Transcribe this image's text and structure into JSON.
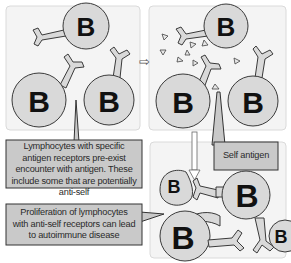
{
  "panels": {
    "top_left": {
      "cells": [
        {
          "label": "B"
        },
        {
          "label": "B"
        },
        {
          "label": "B"
        }
      ]
    },
    "top_right": {
      "cells": [
        {
          "label": "B"
        },
        {
          "label": "B"
        },
        {
          "label": "B"
        }
      ]
    },
    "bottom_right": {
      "cells": [
        {
          "label": "B"
        },
        {
          "label": "B"
        },
        {
          "label": "B"
        },
        {
          "label": "B"
        }
      ]
    }
  },
  "callouts": {
    "pre_exist": "Lymphocytes with specific antigen receptors pre-exist encounter with antigen. These include some that are potentially anti-self",
    "self_antigen": "Self antigen",
    "proliferation": "Proliferation of lymphocytes with anti-self receptors can lead to autoimmune disease"
  },
  "arrows": {
    "right": "⇨",
    "down": "⇩"
  },
  "colors": {
    "cell_fill": "#d9d9d9",
    "callout_fill": "#c9c9c9",
    "panel_bg": "#f4f4f4"
  }
}
